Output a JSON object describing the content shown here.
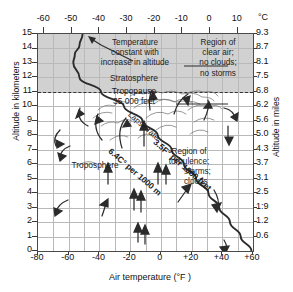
{
  "chart_data": {
    "type": "line",
    "title": "",
    "xlabel": "Air temperature (°F )",
    "ylabel": "Altitude in kilometers",
    "ylabel_right": "Altitude in miles",
    "xlabel_top_unit": "°C",
    "xlim": [
      -80,
      60
    ],
    "ylim": [
      0,
      15
    ],
    "grid": true,
    "legend": "none",
    "x_ticks_f": [
      "-80",
      "-60",
      "-40",
      "-20",
      "0",
      "+20",
      "+40",
      "+60"
    ],
    "x_ticks_f_values": [
      -80,
      -60,
      -40,
      -20,
      0,
      20,
      40,
      60
    ],
    "x_ticks_c": [
      "-60",
      "-50",
      "-40",
      "-30",
      "-20",
      "-10",
      "0",
      "10"
    ],
    "x_ticks_c_values_f": [
      -76,
      -58,
      -40,
      -22,
      -4,
      14,
      32,
      50
    ],
    "y_ticks_km": [
      "15",
      "14",
      "13",
      "12",
      "11",
      "10",
      "9",
      "8",
      "7",
      "6",
      "5",
      "4",
      "3",
      "2",
      "1",
      "0"
    ],
    "y_ticks_km_values": [
      15,
      14,
      13,
      12,
      11,
      10,
      9,
      8,
      7,
      6,
      5,
      4,
      3,
      2,
      1,
      0
    ],
    "y_ticks_miles": [
      "9.3",
      "8.7",
      "8.1",
      "7.5",
      "6.8",
      "6.2",
      "5.6",
      "5.0",
      "4.3",
      "3.7",
      "3.1",
      "2.5",
      "1:9",
      "1.2",
      "0.6"
    ],
    "y_ticks_miles_values": [
      9.3,
      8.7,
      8.1,
      7.5,
      6.8,
      6.2,
      5.6,
      5.0,
      4.3,
      3.7,
      3.1,
      2.5,
      1.9,
      1.2,
      0.6
    ],
    "series": [
      {
        "name": "Temperature profile",
        "points_f_km": [
          [
            59,
            0
          ],
          [
            52,
            1
          ],
          [
            45,
            2
          ],
          [
            38,
            3
          ],
          [
            31,
            4
          ],
          [
            23,
            5
          ],
          [
            15,
            6
          ],
          [
            7,
            7
          ],
          [
            -2,
            8
          ],
          [
            -12,
            9
          ],
          [
            -24,
            10
          ],
          [
            -39,
            11
          ],
          [
            -53,
            12
          ],
          [
            -57,
            13
          ],
          [
            -56,
            13.6
          ],
          [
            -53,
            14.2
          ],
          [
            -51,
            15
          ]
        ]
      }
    ],
    "regions": [
      {
        "name": "Stratosphere",
        "y_range_km": [
          11,
          15
        ],
        "shaded": true,
        "color": "#c9c9c9"
      },
      {
        "name": "Troposphere",
        "y_range_km": [
          0,
          11
        ],
        "shaded": false,
        "color": "#ffffff"
      }
    ],
    "markers": [
      {
        "name": "tropopause",
        "y_km": 11,
        "style": "dashed",
        "label": "Tropopause",
        "sublabel": "35,000 feet"
      }
    ],
    "annotations": [
      "Temperature constant with increase in altitude",
      "Stratosphere",
      "Tropopause",
      "35,000 feet",
      "Region of clear air; no clouds; no storms",
      "Region of turbulence; storms; clouds",
      "Troposphere",
      "Lapse rate",
      "6.4C° per 1000 m",
      "3.5F° per 1000 feet"
    ]
  },
  "axes": {
    "left_title": "Altitude in kilometers",
    "right_title": "Altitude in miles",
    "bottom_title": "Air temperature (°F )",
    "top_unit": "°C"
  },
  "labels": {
    "temp_constant_line1": "Temperature",
    "temp_constant_line2": "constant with",
    "temp_constant_line3": "increase in altitude",
    "stratosphere": "Stratosphere",
    "tropopause": "Tropopause",
    "feet_35000": "35,000 feet",
    "clear_line1": "Region of",
    "clear_line2": "clear air;",
    "clear_line3": "no clouds;",
    "clear_line4": "no storms",
    "turb_line1": "Region of",
    "turb_line2": "turbulence;",
    "turb_line3": "storms;",
    "turb_line4": "clouds",
    "troposphere": "Troposphere",
    "lapse_rate": "Lapse rate",
    "lapse_c": "6.4C° per 1000 m",
    "lapse_f": "3.5F° per 1000 feet"
  },
  "colors": {
    "stratosphere_fill": "#c9c9c9",
    "grid": "#b9b9b9",
    "axis": "#4a4a4a",
    "curve": "#2b2b2b",
    "text": "#1a1a1a"
  }
}
